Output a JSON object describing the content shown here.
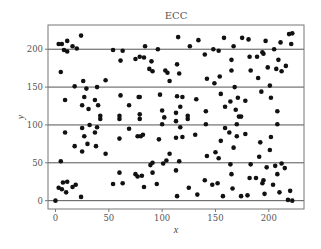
{
  "chart_data": {
    "type": "scatter",
    "title": "ECC",
    "xlabel": "x",
    "ylabel": "y",
    "xlim": [
      -7,
      233
    ],
    "ylim": [
      -11,
      232
    ],
    "xticks": [
      0,
      50,
      100,
      150,
      200
    ],
    "yticks": [
      0,
      50,
      100,
      150,
      200
    ],
    "xtick_labels": [
      "0",
      "50",
      "100",
      "150",
      "200"
    ],
    "ytick_labels": [
      "0",
      "50",
      "100",
      "150",
      "200"
    ],
    "grid": "horizontal at y ticks",
    "legend": "none",
    "marker_color": "#111111",
    "points": [
      [
        0,
        0
      ],
      [
        3,
        17
      ],
      [
        5,
        52
      ],
      [
        6,
        15
      ],
      [
        7,
        24
      ],
      [
        9,
        90
      ],
      [
        10,
        11
      ],
      [
        11,
        25
      ],
      [
        16,
        18
      ],
      [
        19,
        21
      ],
      [
        24,
        5
      ],
      [
        3,
        207
      ],
      [
        6,
        207
      ],
      [
        8,
        199
      ],
      [
        11,
        211
      ],
      [
        11,
        197
      ],
      [
        16,
        204
      ],
      [
        20,
        201
      ],
      [
        24,
        218
      ],
      [
        5,
        170
      ],
      [
        9,
        133
      ],
      [
        18,
        151
      ],
      [
        25,
        126
      ],
      [
        26,
        158
      ],
      [
        27,
        137
      ],
      [
        29,
        148
      ],
      [
        31,
        121
      ],
      [
        37,
        133
      ],
      [
        39,
        150
      ],
      [
        40,
        126
      ],
      [
        42,
        112
      ],
      [
        42,
        108
      ],
      [
        25,
        96
      ],
      [
        27,
        85
      ],
      [
        30,
        75
      ],
      [
        32,
        100
      ],
      [
        37,
        90
      ],
      [
        38,
        72
      ],
      [
        39,
        97
      ],
      [
        18,
        72
      ],
      [
        25,
        65
      ],
      [
        47,
        62
      ],
      [
        47,
        159
      ],
      [
        54,
        22
      ],
      [
        60,
        37
      ],
      [
        60,
        82
      ],
      [
        60,
        112
      ],
      [
        60,
        108
      ],
      [
        61,
        139
      ],
      [
        63,
        23
      ],
      [
        69,
        95
      ],
      [
        69,
        126
      ],
      [
        75,
        35
      ],
      [
        77,
        85
      ],
      [
        77,
        32
      ],
      [
        78,
        137
      ],
      [
        79,
        137
      ],
      [
        79,
        114
      ],
      [
        79,
        108
      ],
      [
        80,
        85
      ],
      [
        82,
        87
      ],
      [
        81,
        33
      ],
      [
        83,
        18
      ],
      [
        54,
        199
      ],
      [
        61,
        185
      ],
      [
        63,
        198
      ],
      [
        75,
        187
      ],
      [
        79,
        190
      ],
      [
        83,
        189
      ],
      [
        84,
        204
      ],
      [
        88,
        174
      ],
      [
        89,
        47
      ],
      [
        91,
        37
      ],
      [
        91,
        50
      ],
      [
        91,
        171
      ],
      [
        90,
        184
      ],
      [
        95,
        22
      ],
      [
        96,
        200
      ],
      [
        97,
        81
      ],
      [
        98,
        140
      ],
      [
        100,
        101
      ],
      [
        100,
        119
      ],
      [
        101,
        49
      ],
      [
        102,
        110
      ],
      [
        103,
        172
      ],
      [
        104,
        53
      ],
      [
        105,
        169
      ],
      [
        107,
        62
      ],
      [
        107,
        158
      ],
      [
        113,
        116
      ],
      [
        113,
        105
      ],
      [
        113,
        83
      ],
      [
        113,
        40
      ],
      [
        114,
        138
      ],
      [
        114,
        6
      ],
      [
        114,
        180
      ],
      [
        116,
        52
      ],
      [
        115,
        216
      ],
      [
        116,
        168
      ],
      [
        117,
        97
      ],
      [
        117,
        124
      ],
      [
        119,
        137
      ],
      [
        119,
        84
      ],
      [
        124,
        112
      ],
      [
        124,
        108
      ],
      [
        125,
        17
      ],
      [
        126,
        204
      ],
      [
        131,
        87
      ],
      [
        132,
        134
      ],
      [
        133,
        8
      ],
      [
        134,
        212
      ],
      [
        140,
        27
      ],
      [
        140,
        193
      ],
      [
        141,
        118
      ],
      [
        141,
        101
      ],
      [
        142,
        59
      ],
      [
        142,
        161
      ],
      [
        147,
        21
      ],
      [
        148,
        200
      ],
      [
        149,
        155
      ],
      [
        150,
        64
      ],
      [
        152,
        23
      ],
      [
        153,
        56
      ],
      [
        153,
        198
      ],
      [
        154,
        164
      ],
      [
        155,
        79
      ],
      [
        155,
        141
      ],
      [
        157,
        6
      ],
      [
        158,
        215
      ],
      [
        159,
        96
      ],
      [
        159,
        124
      ],
      [
        163,
        90
      ],
      [
        164,
        131
      ],
      [
        164,
        48
      ],
      [
        165,
        35
      ],
      [
        165,
        172
      ],
      [
        165,
        186
      ],
      [
        166,
        16
      ],
      [
        167,
        204
      ],
      [
        167,
        70
      ],
      [
        168,
        150
      ],
      [
        169,
        120
      ],
      [
        170,
        101
      ],
      [
        170,
        85
      ],
      [
        171,
        136
      ],
      [
        172,
        111
      ],
      [
        174,
        111
      ],
      [
        174,
        6
      ],
      [
        175,
        215
      ],
      [
        178,
        132
      ],
      [
        178,
        88
      ],
      [
        180,
        7
      ],
      [
        181,
        213
      ],
      [
        182,
        30
      ],
      [
        182,
        190
      ],
      [
        183,
        48
      ],
      [
        183,
        172
      ],
      [
        188,
        30
      ],
      [
        189,
        190
      ],
      [
        190,
        162
      ],
      [
        191,
        58
      ],
      [
        192,
        77
      ],
      [
        193,
        144
      ],
      [
        194,
        23
      ],
      [
        194,
        196
      ],
      [
        195,
        27
      ],
      [
        195,
        194
      ],
      [
        196,
        9
      ],
      [
        197,
        211
      ],
      [
        198,
        44
      ],
      [
        199,
        176
      ],
      [
        201,
        152
      ],
      [
        201,
        67
      ],
      [
        202,
        84
      ],
      [
        202,
        136
      ],
      [
        204,
        21
      ],
      [
        205,
        200
      ],
      [
        206,
        46
      ],
      [
        207,
        174
      ],
      [
        208,
        118
      ],
      [
        208,
        101
      ],
      [
        208,
        35
      ],
      [
        209,
        186
      ],
      [
        210,
        11
      ],
      [
        211,
        209
      ],
      [
        212,
        49
      ],
      [
        212,
        171
      ],
      [
        215,
        43
      ],
      [
        216,
        178
      ],
      [
        218,
        1
      ],
      [
        219,
        220
      ],
      [
        220,
        13
      ],
      [
        221,
        207
      ],
      [
        222,
        0
      ],
      [
        222,
        221
      ]
    ]
  }
}
